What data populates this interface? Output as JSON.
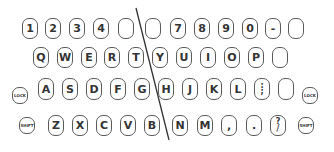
{
  "diagram": {
    "title": "",
    "type": "split-keyboard-layout",
    "colors": {
      "key_border": "#5a5a5a",
      "key_text": "#333333",
      "divider": "#333333",
      "background": "#ffffff"
    },
    "divider": {
      "x1": 136,
      "y1": 8,
      "x2": 169,
      "y2": 140
    },
    "rows": [
      {
        "name": "number-row",
        "keys": [
          {
            "label": "1",
            "x": 22,
            "y": 18,
            "w": 16,
            "h": 21
          },
          {
            "label": "2",
            "x": 45,
            "y": 18,
            "w": 16,
            "h": 21
          },
          {
            "label": "3",
            "x": 69,
            "y": 18,
            "w": 16,
            "h": 21
          },
          {
            "label": "4",
            "x": 93,
            "y": 18,
            "w": 16,
            "h": 21
          },
          {
            "label": "",
            "x": 118,
            "y": 18,
            "w": 16,
            "h": 21
          },
          {
            "label": "",
            "x": 145,
            "y": 18,
            "w": 16,
            "h": 21
          },
          {
            "label": "7",
            "x": 170,
            "y": 18,
            "w": 16,
            "h": 21
          },
          {
            "label": "8",
            "x": 194,
            "y": 18,
            "w": 16,
            "h": 21
          },
          {
            "label": "9",
            "x": 218,
            "y": 18,
            "w": 16,
            "h": 21
          },
          {
            "label": "0",
            "x": 242,
            "y": 18,
            "w": 16,
            "h": 21
          },
          {
            "label": "-",
            "x": 265,
            "y": 18,
            "w": 16,
            "h": 21
          },
          {
            "label": "",
            "x": 288,
            "y": 18,
            "w": 16,
            "h": 21
          }
        ]
      },
      {
        "name": "top-letter-row",
        "keys": [
          {
            "label": "Q",
            "x": 33,
            "y": 47,
            "w": 16,
            "h": 21
          },
          {
            "label": "W",
            "x": 57,
            "y": 47,
            "w": 16,
            "h": 21
          },
          {
            "label": "E",
            "x": 81,
            "y": 47,
            "w": 16,
            "h": 21
          },
          {
            "label": "R",
            "x": 104,
            "y": 47,
            "w": 16,
            "h": 21
          },
          {
            "label": "T",
            "x": 128,
            "y": 47,
            "w": 16,
            "h": 21
          },
          {
            "label": "Y",
            "x": 152,
            "y": 47,
            "w": 16,
            "h": 21
          },
          {
            "label": "U",
            "x": 176,
            "y": 47,
            "w": 16,
            "h": 21
          },
          {
            "label": "I",
            "x": 200,
            "y": 47,
            "w": 16,
            "h": 21
          },
          {
            "label": "O",
            "x": 224,
            "y": 47,
            "w": 16,
            "h": 21
          },
          {
            "label": "P",
            "x": 248,
            "y": 47,
            "w": 16,
            "h": 21
          },
          {
            "label": "",
            "x": 272,
            "y": 47,
            "w": 16,
            "h": 21
          }
        ]
      },
      {
        "name": "home-row",
        "keys": [
          {
            "label": "LOCK",
            "x": 12,
            "y": 87,
            "w": 16,
            "h": 17,
            "mod": true
          },
          {
            "label": "A",
            "x": 38,
            "y": 78,
            "w": 16,
            "h": 22
          },
          {
            "label": "S",
            "x": 62,
            "y": 78,
            "w": 16,
            "h": 22
          },
          {
            "label": "D",
            "x": 86,
            "y": 78,
            "w": 16,
            "h": 22
          },
          {
            "label": "F",
            "x": 110,
            "y": 78,
            "w": 16,
            "h": 22
          },
          {
            "label": "G",
            "x": 134,
            "y": 78,
            "w": 16,
            "h": 22
          },
          {
            "label": "H",
            "x": 158,
            "y": 78,
            "w": 16,
            "h": 22
          },
          {
            "label": "J",
            "x": 182,
            "y": 78,
            "w": 16,
            "h": 22
          },
          {
            "label": "K",
            "x": 206,
            "y": 78,
            "w": 16,
            "h": 22
          },
          {
            "label": "L",
            "x": 230,
            "y": 78,
            "w": 16,
            "h": 22
          },
          {
            "label": ":",
            "label2": ";",
            "x": 254,
            "y": 78,
            "w": 16,
            "h": 22
          },
          {
            "label": "",
            "x": 278,
            "y": 78,
            "w": 16,
            "h": 22
          },
          {
            "label": "LOCK",
            "x": 302,
            "y": 87,
            "w": 16,
            "h": 17,
            "mod": true
          }
        ]
      },
      {
        "name": "bottom-row",
        "keys": [
          {
            "label": "SHIFT",
            "x": 19,
            "y": 117,
            "w": 16,
            "h": 17,
            "mod": true
          },
          {
            "label": "Z",
            "x": 48,
            "y": 115,
            "w": 16,
            "h": 21
          },
          {
            "label": "X",
            "x": 72,
            "y": 115,
            "w": 16,
            "h": 21
          },
          {
            "label": "C",
            "x": 96,
            "y": 115,
            "w": 16,
            "h": 21
          },
          {
            "label": "V",
            "x": 120,
            "y": 115,
            "w": 16,
            "h": 21
          },
          {
            "label": "B",
            "x": 144,
            "y": 115,
            "w": 16,
            "h": 21
          },
          {
            "label": "N",
            "x": 172,
            "y": 115,
            "w": 16,
            "h": 21
          },
          {
            "label": "M",
            "x": 197,
            "y": 115,
            "w": 16,
            "h": 21
          },
          {
            "label": ",",
            "x": 221,
            "y": 115,
            "w": 16,
            "h": 21
          },
          {
            "label": ".",
            "x": 246,
            "y": 115,
            "w": 16,
            "h": 21
          },
          {
            "label": "?",
            "label2": "/",
            "x": 270,
            "y": 115,
            "w": 16,
            "h": 21
          },
          {
            "label": "SHIFT",
            "x": 298,
            "y": 117,
            "w": 16,
            "h": 17,
            "mod": true
          }
        ]
      }
    ]
  }
}
